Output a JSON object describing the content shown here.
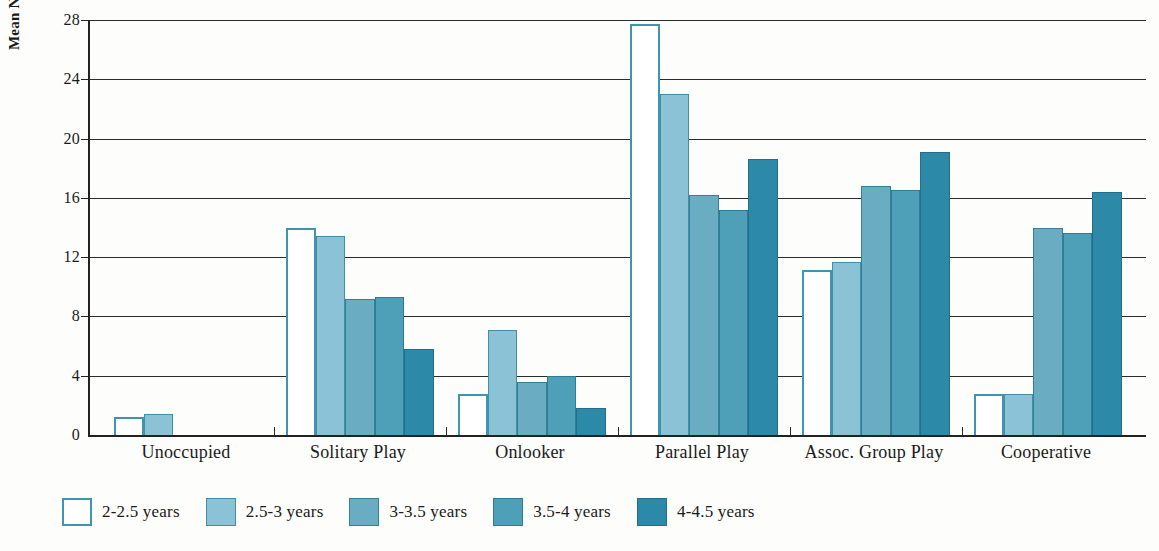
{
  "chart_data": {
    "type": "bar",
    "title": "",
    "xlabel": "",
    "ylabel": "Mean Number of Times",
    "ylim": [
      0,
      28
    ],
    "yticks": [
      0,
      4,
      8,
      12,
      16,
      20,
      24,
      28
    ],
    "grid": true,
    "legend_position": "bottom",
    "categories": [
      "Unoccupied",
      "Solitary Play",
      "Onlooker",
      "Parallel Play",
      "Assoc. Group Play",
      "Cooperative"
    ],
    "series": [
      {
        "name": "2-2.5 years",
        "color": "#ffffff",
        "values": [
          1.2,
          14.0,
          2.8,
          27.7,
          11.1,
          2.8
        ]
      },
      {
        "name": "2.5-3 years",
        "color": "#8cc2d5",
        "values": [
          1.4,
          13.4,
          7.1,
          23.0,
          11.7,
          2.8
        ]
      },
      {
        "name": "3-3.5 years",
        "color": "#6aadc2",
        "values": [
          0.0,
          9.2,
          3.6,
          16.2,
          16.8,
          14.0
        ]
      },
      {
        "name": "3.5-4 years",
        "color": "#4e9fb8",
        "values": [
          0.0,
          9.3,
          4.0,
          15.2,
          16.5,
          13.6
        ]
      },
      {
        "name": "4-4.5 years",
        "color": "#2c8aa8",
        "values": [
          0.0,
          5.8,
          1.85,
          18.6,
          19.1,
          16.4
        ]
      }
    ]
  },
  "axis": {
    "y_title": "Mean Number of Times",
    "y_tick_labels": [
      "28",
      "24",
      "20",
      "16",
      "12",
      "8",
      "4",
      "0"
    ]
  },
  "x_axis": {
    "labels": [
      "Unoccupied",
      "Solitary Play",
      "Onlooker",
      "Parallel Play",
      "Assoc. Group Play",
      "Cooperative"
    ]
  },
  "legend": {
    "items": [
      {
        "label": "2-2.5 years"
      },
      {
        "label": "2.5-3 years"
      },
      {
        "label": "3-3.5 years"
      },
      {
        "label": "3.5-4 years"
      },
      {
        "label": "4-4.5 years"
      }
    ]
  }
}
